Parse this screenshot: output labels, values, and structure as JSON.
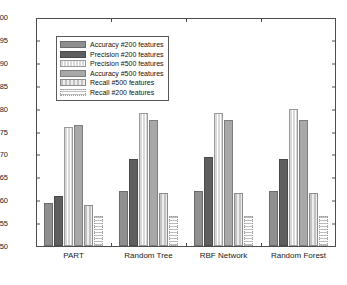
{
  "chart_data": {
    "type": "bar",
    "title": "",
    "xlabel": "",
    "ylabel": "",
    "ylim": [
      50,
      100
    ],
    "yticks": [
      50,
      55,
      60,
      65,
      70,
      75,
      80,
      85,
      90,
      95,
      100
    ],
    "grid": false,
    "legend_position": "upper-left-inside",
    "categories": [
      "PART",
      "Random Tree",
      "RBF Network",
      "Random Forest"
    ],
    "series": [
      {
        "name": "Accuracy #200 features",
        "key": "acc200",
        "values": [
          59.5,
          62.0,
          62.0,
          62.0
        ]
      },
      {
        "name": "Precision #200 features",
        "key": "prec200",
        "values": [
          61.0,
          69.0,
          69.5,
          69.0
        ]
      },
      {
        "name": "Precision #500 features",
        "key": "prec500",
        "values": [
          76.0,
          79.0,
          79.0,
          80.0
        ]
      },
      {
        "name": "Accuracy #500 features",
        "key": "acc500",
        "values": [
          76.5,
          77.5,
          77.5,
          77.5
        ]
      },
      {
        "name": "Recall #500  features",
        "key": "rec500",
        "values": [
          59.0,
          61.5,
          61.5,
          61.5
        ]
      },
      {
        "name": "Recall #200 features",
        "key": "rec200",
        "values": [
          56.5,
          56.5,
          56.5,
          56.5
        ]
      }
    ]
  },
  "legend": {
    "items": [
      {
        "label": "Accuracy #200 features",
        "swatch": "f-acc200"
      },
      {
        "label": "Precision #200 features",
        "swatch": "f-prec200"
      },
      {
        "label": "Precision #500 features",
        "swatch": "f-prec500"
      },
      {
        "label": "Accuracy #500 features",
        "swatch": "f-acc500"
      },
      {
        "label": "Recall #500  features",
        "swatch": "f-rec500"
      },
      {
        "label": "Recall #200 features",
        "swatch": "f-rec200"
      }
    ]
  }
}
